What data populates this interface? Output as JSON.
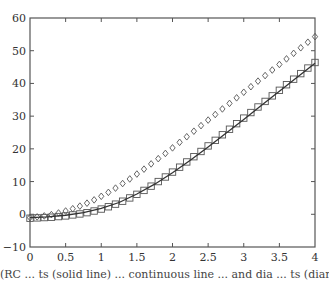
{
  "chart_data": {
    "type": "scatter",
    "title": "",
    "xlabel": "",
    "ylabel": "",
    "xlim": [
      0,
      4
    ],
    "ylim": [
      -10,
      60
    ],
    "xticks": [
      0,
      0.5,
      1,
      1.5,
      2,
      2.5,
      3,
      3.5,
      4
    ],
    "xtick_labels": [
      "0",
      "0.5",
      "1",
      "1.5",
      "2",
      "2.5",
      "3",
      "3.5",
      "4"
    ],
    "yticks": [
      -10,
      0,
      10,
      20,
      30,
      40,
      50,
      60
    ],
    "ytick_labels": [
      "−10",
      "0",
      "10",
      "20",
      "30",
      "40",
      "50",
      "60"
    ],
    "grid": false,
    "legend": null,
    "series": [
      {
        "name": "diamonds",
        "marker": "diamond",
        "line": false,
        "x": [
          0,
          0.1,
          0.2,
          0.3,
          0.4,
          0.5,
          0.6,
          0.7,
          0.8,
          0.9,
          1.0,
          1.1,
          1.2,
          1.3,
          1.4,
          1.5,
          1.6,
          1.7,
          1.8,
          1.9,
          2.0,
          2.1,
          2.2,
          2.3,
          2.4,
          2.5,
          2.6,
          2.7,
          2.8,
          2.9,
          3.0,
          3.1,
          3.2,
          3.3,
          3.4,
          3.5,
          3.6,
          3.7,
          3.8,
          3.9,
          4.0
        ],
        "values": [
          -1,
          -0.8,
          -0.5,
          -0.1,
          0.4,
          1.0,
          1.7,
          2.5,
          3.4,
          4.4,
          5.5,
          6.7,
          8.0,
          9.4,
          10.8,
          12.3,
          13.8,
          15.4,
          17.0,
          18.6,
          20.3,
          22.0,
          23.7,
          25.4,
          27.1,
          28.8,
          30.5,
          32.2,
          33.9,
          35.6,
          37.3,
          39.0,
          40.7,
          42.4,
          44.1,
          45.8,
          47.5,
          49.2,
          50.9,
          52.6,
          54.3
        ]
      },
      {
        "name": "squares",
        "marker": "square",
        "line": false,
        "x": [
          0,
          0.1,
          0.2,
          0.3,
          0.4,
          0.5,
          0.6,
          0.7,
          0.8,
          0.9,
          1.0,
          1.1,
          1.2,
          1.3,
          1.4,
          1.5,
          1.6,
          1.7,
          1.8,
          1.9,
          2.0,
          2.1,
          2.2,
          2.3,
          2.4,
          2.5,
          2.6,
          2.7,
          2.8,
          2.9,
          3.0,
          3.1,
          3.2,
          3.3,
          3.4,
          3.5,
          3.6,
          3.7,
          3.8,
          3.9,
          4.0
        ],
        "values": [
          -1.2,
          -1.1,
          -1.0,
          -0.9,
          -0.7,
          -0.5,
          -0.2,
          0.1,
          0.5,
          1.0,
          1.6,
          2.3,
          3.1,
          4.0,
          5.0,
          6.1,
          7.3,
          8.6,
          10.0,
          11.4,
          12.9,
          14.4,
          16.0,
          17.6,
          19.2,
          20.9,
          22.6,
          24.3,
          26.0,
          27.7,
          29.4,
          31.1,
          32.8,
          34.5,
          36.2,
          37.9,
          39.6,
          41.3,
          43.0,
          44.7,
          46.4
        ]
      },
      {
        "name": "solid line",
        "marker": "none",
        "line": true,
        "x": [
          0,
          0.25,
          0.5,
          0.75,
          1.0,
          1.25,
          1.5,
          1.75,
          2.0,
          2.25,
          2.5,
          2.75,
          3.0,
          3.25,
          3.5,
          3.75,
          4.0
        ],
        "values": [
          -1.0,
          -0.8,
          -0.3,
          0.5,
          1.8,
          3.6,
          6.2,
          9.2,
          12.7,
          16.5,
          20.6,
          24.8,
          29.0,
          33.3,
          37.6,
          41.9,
          46.2
        ]
      }
    ]
  },
  "caption": "(RC ... ts (solid line) ... continuous line ... and dia ... ts (diamond) with"
}
